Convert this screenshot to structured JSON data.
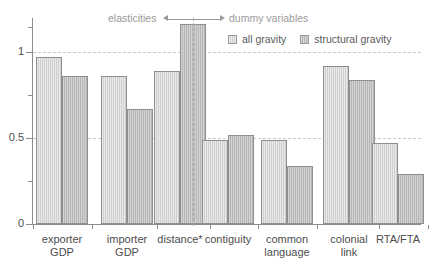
{
  "chart_data": {
    "type": "bar",
    "title": "",
    "subtitle": "",
    "xlabel": "",
    "ylabel": "",
    "ylim": [
      0,
      1.2
    ],
    "yticks": [
      0,
      0.5,
      1
    ],
    "ytick_labels": [
      "0",
      "0.5",
      "1"
    ],
    "yminor_ticks": [
      0.25,
      0.75,
      1.15
    ],
    "gridlines": [
      0.5,
      1
    ],
    "grid": true,
    "legend_position": "top-right",
    "categories": [
      "exporter\nGDP",
      "importer\nGDP",
      "distance*",
      "contiguity",
      "common\nlanguage",
      "colonial\nlink",
      "RTA/FTA"
    ],
    "series": [
      {
        "name": "all gravity",
        "color": "#cfcfcf",
        "values": [
          0.97,
          0.86,
          0.89,
          0.49,
          0.49,
          0.92,
          0.47
        ]
      },
      {
        "name": "structural gravity",
        "color": "#b6b6b6",
        "values": [
          0.86,
          0.67,
          1.16,
          0.52,
          0.34,
          0.84,
          0.29
        ]
      }
    ],
    "annotations": [
      {
        "text": "elasticities",
        "side": "left"
      },
      {
        "text": "dummy variables",
        "side": "right"
      }
    ],
    "divider": {
      "after_category_index": 2,
      "style": "dashed"
    }
  },
  "legend": {
    "entries": [
      {
        "label": "all gravity",
        "swatch": "series-a-swatch"
      },
      {
        "label": "structural gravity",
        "swatch": "series-b-swatch"
      }
    ]
  },
  "axis": {
    "y_labels": [
      "1",
      "0.5",
      "0"
    ]
  },
  "annotations": {
    "left_text": "elasticities",
    "right_text": "dummy variables"
  }
}
